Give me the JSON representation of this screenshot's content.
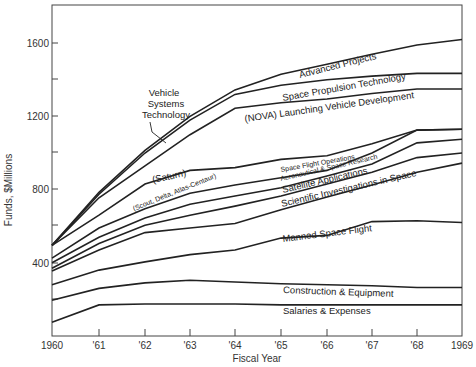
{
  "chart_data": {
    "type": "area",
    "stacked": true,
    "title": "",
    "xlabel": "Fiscal Year",
    "ylabel": "Funds, $Millions",
    "x": [
      "1960",
      "'61",
      "'62",
      "'63",
      "'64",
      "'65",
      "'66",
      "'67",
      "'68",
      "1969"
    ],
    "yticks": [
      400,
      800,
      1200,
      1600
    ],
    "ylim": [
      0,
      1800
    ],
    "grid": false,
    "note": "Values are cumulative (top edge of each band), $Millions",
    "series": [
      {
        "name": "Salaries & Expenses",
        "values": [
          75,
          170,
          175,
          175,
          175,
          170,
          170,
          170,
          170,
          170
        ]
      },
      {
        "name": "Construction & Equipment",
        "values": [
          195,
          260,
          290,
          305,
          295,
          285,
          280,
          275,
          265,
          265
        ]
      },
      {
        "name": "Manned Space Flight",
        "values": [
          280,
          360,
          405,
          445,
          470,
          535,
          550,
          625,
          630,
          620
        ]
      },
      {
        "name": "Scientific Investigations in Space",
        "values": [
          355,
          470,
          565,
          590,
          615,
          690,
          760,
          825,
          895,
          945
        ]
      },
      {
        "name": "Satellite Applications",
        "values": [
          370,
          505,
          605,
          660,
          710,
          765,
          830,
          895,
          975,
          1000
        ]
      },
      {
        "name": "Aeronautical & Space Research",
        "values": [
          400,
          540,
          645,
          720,
          765,
          810,
          875,
          940,
          1055,
          1075
        ]
      },
      {
        "name": "Space Flight Operations",
        "values": [
          425,
          590,
          695,
          780,
          825,
          865,
          905,
          1000,
          1125,
          1130
        ]
      },
      {
        "name": "(Saturn)",
        "values": [
          495,
          660,
          830,
          905,
          920,
          965,
          985,
          1050,
          1125,
          1130
        ]
      },
      {
        "name": "(NOVA) Launching Vehicle Development",
        "values": [
          495,
          755,
          930,
          1100,
          1245,
          1275,
          1295,
          1325,
          1350,
          1350
        ]
      },
      {
        "name": "Space Propulsion Technology",
        "values": [
          495,
          775,
          1000,
          1180,
          1320,
          1370,
          1400,
          1420,
          1435,
          1435
        ]
      },
      {
        "name": "Advanced Projects",
        "values": [
          495,
          785,
          1015,
          1200,
          1345,
          1430,
          1485,
          1540,
          1590,
          1620
        ]
      }
    ],
    "annotations": [
      "Vehicle Systems Technology",
      "(Scout, Delta, Atlas-Centaur)"
    ]
  },
  "labels": {
    "advanced": "Advanced Projects",
    "propulsion": "Space Propulsion Technology",
    "nova": "(NOVA) Launching Vehicle Development",
    "vst1": "Vehicle",
    "vst2": "Systems",
    "vst3": "Technology",
    "saturn": "(Saturn)",
    "scout": "(Scout, Delta, Atlas-Centaur)",
    "sfo": "Space Flight Operations",
    "aero": "Aeronautical & Space Research",
    "satellite": "Satellite Applications",
    "scientific": "Scientific Investigations in Space",
    "manned": "Manned Space Flight",
    "construction": "Construction & Equipment",
    "salaries": "Salaries & Expenses"
  },
  "axis": {
    "ylabel": "Funds, $Millions",
    "xlabel": "Fiscal Year",
    "yticks": [
      "1600",
      "1200",
      "800",
      "400"
    ],
    "xticks": [
      "1960",
      "'61",
      "'62",
      "'63",
      "'64",
      "'65",
      "'66",
      "'67",
      "'68",
      "1969"
    ]
  }
}
